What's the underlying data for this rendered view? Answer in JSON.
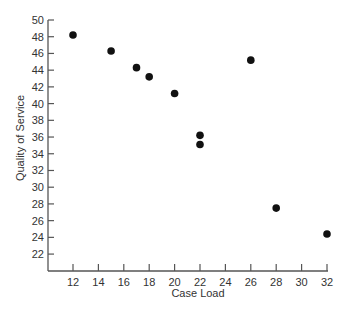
{
  "chart_data": {
    "type": "scatter",
    "title": "",
    "xlabel": "Case Load",
    "ylabel": "Quality of Service",
    "xlim": [
      10,
      32
    ],
    "ylim": [
      20,
      50
    ],
    "xticks": [
      12,
      14,
      16,
      18,
      20,
      22,
      24,
      26,
      28,
      30,
      32
    ],
    "yticks": [
      22,
      24,
      26,
      28,
      30,
      32,
      34,
      36,
      38,
      40,
      42,
      44,
      46,
      48,
      50
    ],
    "grid": false,
    "legend": null,
    "marker_color": "#111111",
    "points": [
      {
        "x": 12,
        "y": 48.2
      },
      {
        "x": 15,
        "y": 46.3
      },
      {
        "x": 17,
        "y": 44.3
      },
      {
        "x": 18,
        "y": 43.2
      },
      {
        "x": 20,
        "y": 41.2
      },
      {
        "x": 22,
        "y": 36.2
      },
      {
        "x": 22,
        "y": 35.1
      },
      {
        "x": 26,
        "y": 45.2
      },
      {
        "x": 28,
        "y": 27.5
      },
      {
        "x": 32,
        "y": 24.4
      }
    ]
  }
}
